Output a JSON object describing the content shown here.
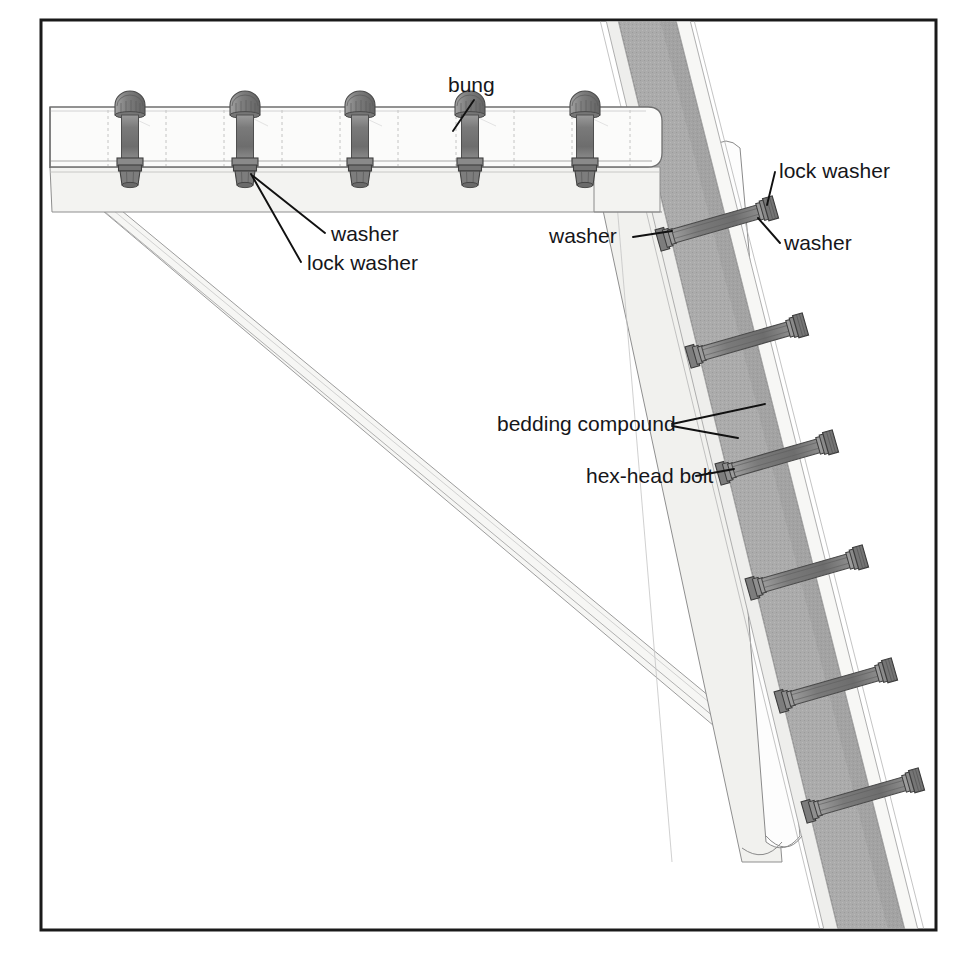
{
  "figure": {
    "kind": "technical-assembly-illustration",
    "background_color": "#ffffff",
    "border_color": "#1a1a1a"
  },
  "frame": {
    "x": 41,
    "y": 20,
    "width": 895,
    "height": 910,
    "stroke_width": 3
  },
  "palette": {
    "outline": "#3c3c3c",
    "hairline": "#9a9a9a",
    "light_fill": "#f4f4f2",
    "pale_fill": "#fafafa",
    "panel_fill": "#ededea",
    "band_fill": "#a8a8a8",
    "band_fill_dark": "#9c9c9c",
    "metal_dark": "#6a6a6a",
    "metal_mid": "#848484",
    "metal_light": "#b4b4b4",
    "label_text": "#16161a",
    "leader_line": "#111111"
  },
  "labels": [
    {
      "id": "bung",
      "text": "bung",
      "x": 448,
      "y": 92,
      "anchor": "start",
      "leaders": [
        {
          "x1": 474,
          "y1": 100,
          "x2": 453,
          "y2": 131
        }
      ]
    },
    {
      "id": "washer-left",
      "text": "washer",
      "x": 331,
      "y": 241,
      "anchor": "start",
      "leaders": [
        {
          "x1": 325,
          "y1": 233,
          "x2": 253,
          "y2": 176
        }
      ]
    },
    {
      "id": "lock-washer-left",
      "text": "lock washer",
      "x": 307,
      "y": 270,
      "anchor": "start",
      "leaders": [
        {
          "x1": 301,
          "y1": 262,
          "x2": 251,
          "y2": 174
        }
      ]
    },
    {
      "id": "lock-washer-right",
      "text": "lock washer",
      "x": 779,
      "y": 178,
      "anchor": "start",
      "leaders": [
        {
          "x1": 775,
          "y1": 172,
          "x2": 767,
          "y2": 205
        }
      ]
    },
    {
      "id": "washer-right",
      "text": "washer",
      "x": 784,
      "y": 250,
      "anchor": "start",
      "leaders": [
        {
          "x1": 780,
          "y1": 243,
          "x2": 758,
          "y2": 218
        }
      ]
    },
    {
      "id": "washer-mid",
      "text": "washer",
      "x": 549,
      "y": 243,
      "anchor": "start",
      "leaders": [
        {
          "x1": 633,
          "y1": 237,
          "x2": 672,
          "y2": 231
        }
      ]
    },
    {
      "id": "bedding-compound",
      "text": "bedding compound",
      "x": 497,
      "y": 431,
      "anchor": "start",
      "leaders": [
        {
          "x1": 672,
          "y1": 424,
          "x2": 762,
          "y2": 404
        },
        {
          "x1": 672,
          "y1": 426,
          "x2": 736,
          "y2": 437
        }
      ]
    },
    {
      "id": "hex-head-bolt",
      "text": "hex-head bolt",
      "x": 586,
      "y": 483,
      "anchor": "start",
      "leaders": [
        {
          "x1": 696,
          "y1": 476,
          "x2": 733,
          "y2": 469
        }
      ]
    }
  ],
  "top_beam": {
    "name": "horizontal beam",
    "top_y": 107,
    "bottom_y": 167,
    "left_x": 50,
    "right_x": 660,
    "segment_divider_count": 6,
    "under_flange_bottom_y": 212
  },
  "vertical_bolts": [
    {
      "id": "vbolt-1",
      "cx": 130,
      "head_y": 115,
      "tail_y": 185
    },
    {
      "id": "vbolt-2",
      "cx": 245,
      "head_y": 115,
      "tail_y": 185
    },
    {
      "id": "vbolt-3",
      "cx": 360,
      "head_y": 115,
      "tail_y": 185
    },
    {
      "id": "vbolt-4",
      "cx": 470,
      "head_y": 115,
      "tail_y": 185
    },
    {
      "id": "vbolt-5",
      "cx": 585,
      "head_y": 115,
      "tail_y": 185
    }
  ],
  "diagonal_band": {
    "name": "diagonal brace band",
    "top_left_x": 618,
    "top_right_x": 672,
    "bottom_left_x": 835,
    "bottom_right_x": 900,
    "top_y": 20,
    "bottom_y": 930
  },
  "diagonal_bolts": [
    {
      "id": "dbolt-1",
      "x1": 662,
      "y1": 240,
      "x2": 778,
      "y2": 207
    },
    {
      "id": "dbolt-2",
      "x1": 692,
      "y1": 357,
      "x2": 808,
      "y2": 322
    },
    {
      "id": "dbolt-3",
      "x1": 722,
      "y1": 474,
      "x2": 838,
      "y2": 440
    },
    {
      "id": "dbolt-4",
      "x1": 752,
      "y1": 589,
      "x2": 868,
      "y2": 555
    },
    {
      "id": "dbolt-5",
      "x1": 781,
      "y1": 702,
      "x2": 897,
      "y2": 668
    },
    {
      "id": "dbolt-6",
      "x1": 808,
      "y1": 812,
      "x2": 924,
      "y2": 778
    }
  ],
  "knee_brace": {
    "name": "diagonal knee brace",
    "start_x": 52,
    "start_y": 168,
    "end_x": 768,
    "end_y": 760,
    "thickness": 26
  },
  "icons": {
    "bolt_head": "hex-bolt-head-icon",
    "nut": "nut-icon",
    "washer": "washer-icon",
    "lock_washer": "lock-washer-icon"
  }
}
